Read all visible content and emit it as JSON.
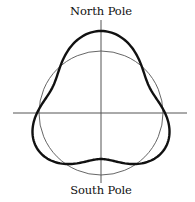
{
  "labels": {
    "north": "North Pole",
    "south": "South Pole"
  },
  "geometry": {
    "center": [
      101,
      113
    ],
    "circle_radius": 62,
    "h_axis": {
      "x1": 13,
      "x2": 187,
      "y": 113
    },
    "v_axis": {
      "x": 101,
      "y1": 20,
      "y2": 183
    },
    "shape": {
      "base": 64,
      "a1": 6,
      "a3": 12
    },
    "colors": {
      "axis": "#555555",
      "circle": "#555555",
      "shape": "#111111"
    }
  }
}
